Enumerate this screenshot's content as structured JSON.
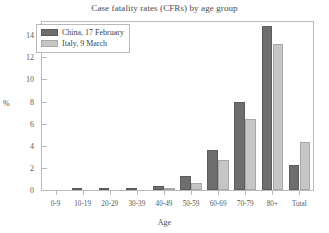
{
  "chart_data": {
    "type": "bar",
    "title": "Case fatality rates (CFRs) by age group",
    "xlabel": "Age",
    "ylabel": "%",
    "categories": [
      "0-9",
      "10-19",
      "20-29",
      "30-39",
      "40-49",
      "50-59",
      "60-69",
      "70-79",
      "80+",
      "Total"
    ],
    "series": [
      {
        "name": "China, 17 February",
        "color": "#6e6e6e",
        "values": [
          0.0,
          0.2,
          0.2,
          0.2,
          0.4,
          1.3,
          3.6,
          8.0,
          14.8,
          2.3
        ]
      },
      {
        "name": "Italy, 9 March",
        "color": "#c6c6c6",
        "values": [
          0.0,
          0.0,
          0.0,
          0.0,
          0.1,
          0.6,
          2.7,
          6.4,
          13.2,
          4.3
        ]
      }
    ],
    "ylim": [
      0,
      15.2
    ],
    "yticks": [
      0,
      2,
      4,
      6,
      8,
      10,
      12,
      14
    ],
    "grid": false,
    "legend_position": "top-left"
  }
}
